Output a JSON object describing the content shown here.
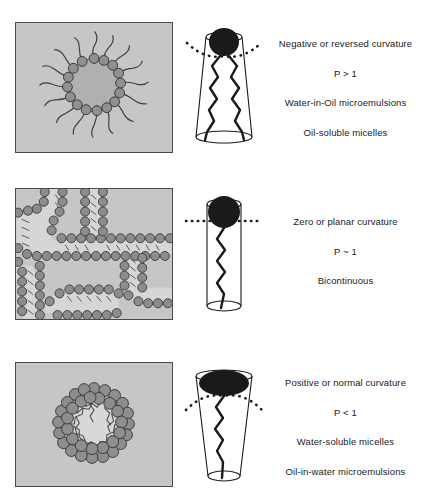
{
  "figure": {
    "rows": [
      {
        "id": "negative-curvature",
        "panel_name": "reverse-micelle-illustration",
        "panel_alt": "Reverse micelle: polar head groups facing a water core with hydrocarbon tails radiating outward into oil",
        "molecule_name": "inverted-cone-surfactant",
        "molecule_alt": "Inverted truncated cone, narrow at the head, wide at the tails, with two hydrocarbon chains and a convex dotted interface line",
        "labels": [
          "Negative or reversed curvature",
          "P > 1",
          "Water-in-Oil microemulsions",
          "Oil-soluble micelles"
        ]
      },
      {
        "id": "zero-curvature",
        "panel_name": "bicontinuous-illustration",
        "panel_alt": "Bicontinuous structure of interpenetrating water and oil channels separated by surfactant bilayers",
        "molecule_name": "cylinder-surfactant",
        "molecule_alt": "Cylinder with one hydrocarbon chain and a flat horizontal dotted interface line",
        "labels": [
          "Zero or planar curvature",
          "P ~ 1",
          "Bicontinuous"
        ]
      },
      {
        "id": "positive-curvature",
        "panel_name": "normal-micelle-illustration",
        "panel_alt": "Normal micelle: polar head groups facing outward into water with hydrocarbon tails packed into an oil core",
        "molecule_name": "upright-cone-surfactant",
        "molecule_alt": "Upright truncated cone, wide at the head, narrow at the tail, with one hydrocarbon chain and a concave dotted interface line",
        "labels": [
          "Positive or normal curvature",
          "P < 1",
          "Water-soluble micelles",
          "Oil-in-water microemulsions"
        ]
      }
    ]
  },
  "colors": {
    "page_background": "#ffffff",
    "panel_background": "#c6c6c6",
    "panel_border": "#4a4a4a",
    "core_dark": "#b0b0b0",
    "core_light": "#d8d8d8",
    "head_bead_fill": "#909090",
    "head_bead_stroke": "#3a3a3a",
    "tail_stroke": "#3f3f3f",
    "molecule_head_fill": "#1a1a1a",
    "molecule_outline": "#1a1a1a",
    "text": "#1a1a1a"
  }
}
